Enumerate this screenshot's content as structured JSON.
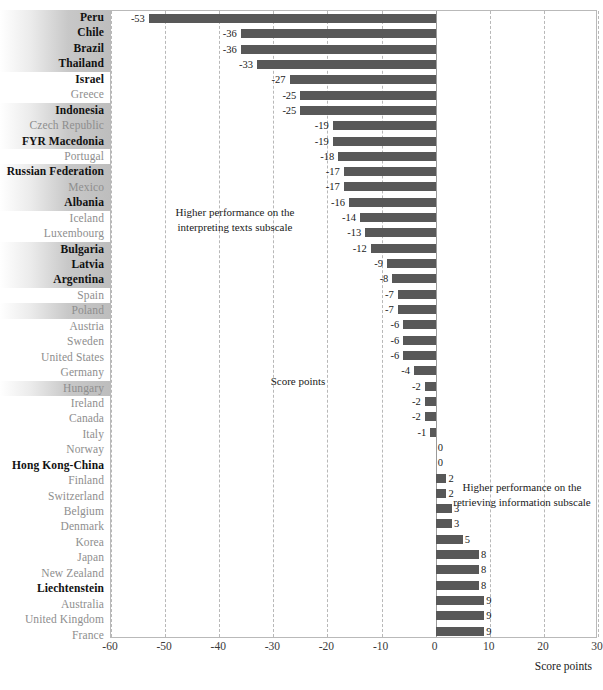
{
  "chart_data": {
    "type": "bar",
    "orientation": "horizontal",
    "title": "",
    "xlabel": "Score points",
    "ylabel": "",
    "xlim": [
      -60,
      30
    ],
    "xticks": [
      -60,
      -50,
      -40,
      -30,
      -20,
      -10,
      0,
      10,
      20,
      30
    ],
    "grid": true,
    "legend": "none",
    "annotations": [
      "Higher performance on the interpreting texts subscale",
      "Higher performance on the retrieving information subscale",
      "Score points"
    ],
    "categories": [
      "Peru",
      "Chile",
      "Brazil",
      "Thailand",
      "Israel",
      "Greece",
      "Indonesia",
      "Czech Republic",
      "FYR Macedonia",
      "Portugal",
      "Russian Federation",
      "Mexico",
      "Albania",
      "Iceland",
      "Luxembourg",
      "Bulgaria",
      "Latvia",
      "Argentina",
      "Spain",
      "Poland",
      "Austria",
      "Sweden",
      "United States",
      "Germany",
      "Hungary",
      "Ireland",
      "Canada",
      "Italy",
      "Norway",
      "Hong Kong-China",
      "Finland",
      "Switzerland",
      "Belgium",
      "Denmark",
      "Korea",
      "Japan",
      "New Zealand",
      "Liechtenstein",
      "Australia",
      "United Kingdom",
      "France"
    ],
    "values": [
      -53,
      -36,
      -36,
      -33,
      -27,
      -25,
      -25,
      -19,
      -19,
      -18,
      -17,
      -17,
      -16,
      -14,
      -13,
      -12,
      -9,
      -8,
      -7,
      -7,
      -6,
      -6,
      -6,
      -4,
      -2,
      -2,
      -2,
      -1,
      0,
      0,
      2,
      2,
      3,
      3,
      5,
      8,
      8,
      8,
      9,
      9,
      9
    ]
  },
  "rows": [
    {
      "label": "Peru",
      "value": -53,
      "value_text": "-53",
      "bold": true,
      "highlight": true
    },
    {
      "label": "Chile",
      "value": -36,
      "value_text": "-36",
      "bold": true,
      "highlight": true
    },
    {
      "label": "Brazil",
      "value": -36,
      "value_text": "-36",
      "bold": true,
      "highlight": true
    },
    {
      "label": "Thailand",
      "value": -33,
      "value_text": "-33",
      "bold": true,
      "highlight": true
    },
    {
      "label": "Israel",
      "value": -27,
      "value_text": "-27",
      "bold": true,
      "highlight": false
    },
    {
      "label": "Greece",
      "value": -25,
      "value_text": "-25",
      "bold": false,
      "highlight": false
    },
    {
      "label": "Indonesia",
      "value": -25,
      "value_text": "-25",
      "bold": true,
      "highlight": true
    },
    {
      "label": "Czech Republic",
      "value": -19,
      "value_text": "-19",
      "bold": false,
      "highlight": true
    },
    {
      "label": "FYR Macedonia",
      "value": -19,
      "value_text": "-19",
      "bold": true,
      "highlight": true
    },
    {
      "label": "Portugal",
      "value": -18,
      "value_text": "-18",
      "bold": false,
      "highlight": false
    },
    {
      "label": "Russian Federation",
      "value": -17,
      "value_text": "-17",
      "bold": true,
      "highlight": true
    },
    {
      "label": "Mexico",
      "value": -17,
      "value_text": "-17",
      "bold": false,
      "highlight": true
    },
    {
      "label": "Albania",
      "value": -16,
      "value_text": "-16",
      "bold": true,
      "highlight": true
    },
    {
      "label": "Iceland",
      "value": -14,
      "value_text": "-14",
      "bold": false,
      "highlight": false
    },
    {
      "label": "Luxembourg",
      "value": -13,
      "value_text": "-13",
      "bold": false,
      "highlight": false
    },
    {
      "label": "Bulgaria",
      "value": -12,
      "value_text": "-12",
      "bold": true,
      "highlight": true
    },
    {
      "label": "Latvia",
      "value": -9,
      "value_text": "-9",
      "bold": true,
      "highlight": true
    },
    {
      "label": "Argentina",
      "value": -8,
      "value_text": "-8",
      "bold": true,
      "highlight": true
    },
    {
      "label": "Spain",
      "value": -7,
      "value_text": "-7",
      "bold": false,
      "highlight": false
    },
    {
      "label": "Poland",
      "value": -7,
      "value_text": "-7",
      "bold": false,
      "highlight": true
    },
    {
      "label": "Austria",
      "value": -6,
      "value_text": "-6",
      "bold": false,
      "highlight": false
    },
    {
      "label": "Sweden",
      "value": -6,
      "value_text": "-6",
      "bold": false,
      "highlight": false
    },
    {
      "label": "United States",
      "value": -6,
      "value_text": "-6",
      "bold": false,
      "highlight": false
    },
    {
      "label": "Germany",
      "value": -4,
      "value_text": "-4",
      "bold": false,
      "highlight": false
    },
    {
      "label": "Hungary",
      "value": -2,
      "value_text": "-2",
      "bold": false,
      "highlight": true
    },
    {
      "label": "Ireland",
      "value": -2,
      "value_text": "-2",
      "bold": false,
      "highlight": false
    },
    {
      "label": "Canada",
      "value": -2,
      "value_text": "-2",
      "bold": false,
      "highlight": false
    },
    {
      "label": "Italy",
      "value": -1,
      "value_text": "-1",
      "bold": false,
      "highlight": false
    },
    {
      "label": "Norway",
      "value": 0,
      "value_text": "0",
      "bold": false,
      "highlight": false
    },
    {
      "label": "Hong Kong-China",
      "value": 0,
      "value_text": "0",
      "bold": true,
      "highlight": false
    },
    {
      "label": "Finland",
      "value": 2,
      "value_text": "2",
      "bold": false,
      "highlight": false
    },
    {
      "label": "Switzerland",
      "value": 2,
      "value_text": "2",
      "bold": false,
      "highlight": false
    },
    {
      "label": "Belgium",
      "value": 3,
      "value_text": "3",
      "bold": false,
      "highlight": false
    },
    {
      "label": "Denmark",
      "value": 3,
      "value_text": "3",
      "bold": false,
      "highlight": false
    },
    {
      "label": "Korea",
      "value": 5,
      "value_text": "5",
      "bold": false,
      "highlight": false
    },
    {
      "label": "Japan",
      "value": 8,
      "value_text": "8",
      "bold": false,
      "highlight": false
    },
    {
      "label": "New Zealand",
      "value": 8,
      "value_text": "8",
      "bold": false,
      "highlight": false
    },
    {
      "label": "Liechtenstein",
      "value": 8,
      "value_text": "8",
      "bold": true,
      "highlight": false
    },
    {
      "label": "Australia",
      "value": 9,
      "value_text": "9",
      "bold": false,
      "highlight": false
    },
    {
      "label": "United Kingdom",
      "value": 9,
      "value_text": "9",
      "bold": false,
      "highlight": false
    },
    {
      "label": "France",
      "value": 9,
      "value_text": "9",
      "bold": false,
      "highlight": false
    }
  ],
  "axis": {
    "ticks": [
      "-60",
      "-50",
      "-40",
      "-30",
      "-20",
      "-10",
      "0",
      "10",
      "20",
      "30"
    ],
    "tick_values": [
      -60,
      -50,
      -40,
      -30,
      -20,
      -10,
      0,
      10,
      20,
      30
    ],
    "title": "Score points",
    "min": -60,
    "max": 30
  },
  "annotations": {
    "left": "Higher performance on the interpreting texts subscale",
    "right": "Higher performance on the retrieving information subscale",
    "center": "Score points"
  },
  "colors": {
    "bar": "#585858",
    "gridline": "#b8b8b8",
    "zero_line": "#9a9a9a",
    "label_muted": "#8e8e8e",
    "label_bold": "#111111",
    "highlight_band": "#bebebe",
    "plot_border": "#b9b9b9"
  },
  "source": {
    "text": ""
  }
}
